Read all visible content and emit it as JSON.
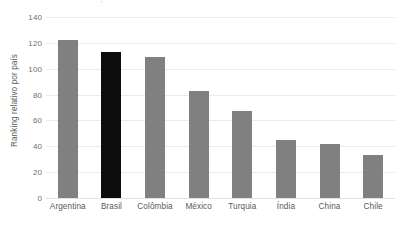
{
  "chart_data": {
    "type": "bar",
    "title": "",
    "xlabel": "",
    "ylabel": "Ranking relativo por país",
    "categories": [
      "Argentina",
      "Brasil",
      "Colômbia",
      "México",
      "Turquia",
      "Índia",
      "China",
      "Chile"
    ],
    "values": [
      122,
      113,
      109,
      83,
      67,
      45,
      42,
      33
    ],
    "ylim": [
      0,
      140
    ],
    "yticks": [
      0,
      20,
      40,
      60,
      80,
      100,
      120,
      140
    ],
    "ytick_labels": [
      "0",
      "20",
      "40",
      "60",
      "80",
      "100",
      "120",
      "140"
    ],
    "grid": "horizontal",
    "legend": "none",
    "highlight_category": "Brasil",
    "bar_color": "#808080",
    "highlight_color": "#0d0d0d",
    "gridline_color": "#e8eaec",
    "axis_text_color": "#595959",
    "tick_text_color": "#707070"
  },
  "title_remnant": {
    "text": "•"
  }
}
